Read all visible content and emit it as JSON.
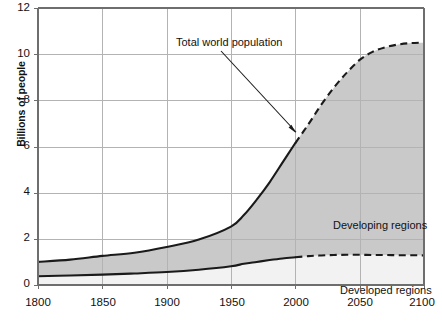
{
  "chart_data": {
    "type": "area",
    "title": "",
    "subtitle": "",
    "xlabel": "",
    "ylabel": "Billions of people",
    "xlim": [
      1800,
      2100
    ],
    "ylim": [
      0,
      12
    ],
    "xticks": [
      1800,
      1850,
      1900,
      1950,
      2000,
      2050,
      2100
    ],
    "yticks": [
      0,
      2,
      4,
      6,
      8,
      10,
      12
    ],
    "grid": true,
    "legend_position": "inline-annotations",
    "projection_starts": 2000,
    "x": [
      1800,
      1825,
      1850,
      1875,
      1900,
      1925,
      1950,
      1960,
      1970,
      1980,
      1990,
      2000,
      2010,
      2020,
      2030,
      2040,
      2050,
      2060,
      2070,
      2080,
      2090,
      2100
    ],
    "series": [
      {
        "name": "Total world population",
        "values": [
          1.0,
          1.1,
          1.26,
          1.4,
          1.65,
          1.97,
          2.53,
          3.03,
          3.7,
          4.45,
          5.3,
          6.15,
          6.95,
          7.8,
          8.55,
          9.2,
          9.75,
          10.1,
          10.3,
          10.42,
          10.48,
          10.5
        ],
        "style": "solid-to-dashed"
      },
      {
        "name": "Developed regions",
        "values": [
          0.38,
          0.41,
          0.45,
          0.5,
          0.56,
          0.66,
          0.81,
          0.92,
          1.0,
          1.08,
          1.15,
          1.2,
          1.25,
          1.28,
          1.3,
          1.31,
          1.31,
          1.3,
          1.3,
          1.29,
          1.29,
          1.28
        ],
        "style": "solid-to-dashed"
      }
    ],
    "bands": [
      {
        "name": "Developing regions",
        "description": "Shaded area between the developed-regions curve and the total world population curve",
        "fill": "#c9c9c9"
      },
      {
        "name": "Developed regions",
        "description": "Area below the developed-regions curve",
        "fill": "#f2f2f2"
      }
    ],
    "annotations": [
      {
        "id": "annot-total",
        "text": "Total world population",
        "points_to_year": 2000,
        "points_to_value": 6.2
      },
      {
        "id": "label-developing",
        "text": "Developing regions"
      },
      {
        "id": "label-developed",
        "text": "Developed regions"
      }
    ]
  },
  "axes": {
    "y_title": "Billions of people",
    "y_tick_labels": [
      "12",
      "10",
      "8",
      "6",
      "4",
      "2",
      "0"
    ],
    "x_tick_labels": [
      "1800",
      "1850",
      "1900",
      "1950",
      "2000",
      "2050",
      "2100"
    ]
  },
  "colors": {
    "developing_fill": "#c9c9c9",
    "developed_fill": "#f2f2f2",
    "curve": "#1a1a1a",
    "grid": "#b3b3b3",
    "axis": "#6e6e6e",
    "text": "#111111"
  }
}
